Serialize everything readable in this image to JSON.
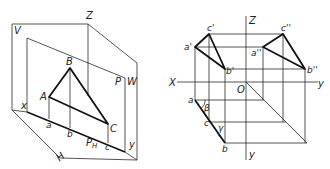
{
  "figure_left": {
    "title": "Spatial view of triangle ABC parallel to projection plane P",
    "labels": {
      "Z": "Z",
      "V": "V",
      "P": "P",
      "W": "W",
      "x": "x",
      "y": "y",
      "H": "H",
      "A": "A",
      "B": "B",
      "C": "C",
      "a": "a",
      "b": "b",
      "c": "c",
      "PH": "P",
      "PH_sub": "H"
    }
  },
  "figure_right": {
    "title": "Orthographic projection of triangle",
    "labels": {
      "Z": "Z",
      "X": "X",
      "O": "O",
      "y_right": "y",
      "y_bottom": "y",
      "a1": "a'",
      "b1": "b'",
      "c1": "c'",
      "a2": "a''",
      "b2": "b''",
      "c2": "c''",
      "a": "a",
      "b": "b",
      "c": "c",
      "beta": "β",
      "gamma": "γ"
    }
  }
}
